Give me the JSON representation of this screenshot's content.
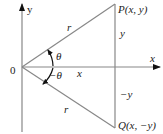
{
  "diagram": {
    "type": "coordinate-geometry",
    "axes": {
      "x_label": "x",
      "y_label": "y",
      "origin_label": "0"
    },
    "points": [
      {
        "id": "P",
        "label": "P(x, y)"
      },
      {
        "id": "Q",
        "label": "Q(x, −y)"
      }
    ],
    "segments": {
      "upper_radius_label": "r",
      "lower_radius_label": "r",
      "upper_vertical_label": "y",
      "lower_vertical_label": "−y",
      "horizontal_label": "x"
    },
    "angles": {
      "upper": "θ",
      "lower": "−θ"
    },
    "colors": {
      "line": "#888888",
      "text": "#222222",
      "arrow": "#111111"
    }
  }
}
